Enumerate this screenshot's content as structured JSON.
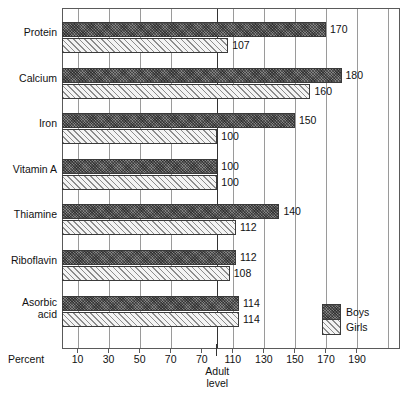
{
  "chart_data": {
    "type": "bar",
    "orientation": "horizontal",
    "title": "",
    "xlabel": "Percent",
    "ylabel": "",
    "categories": [
      "Protein",
      "Calcium",
      "Iron",
      "Vitamin A",
      "Thiamine",
      "Riboflavin",
      "Asorbic acid"
    ],
    "series": [
      {
        "name": "Boys",
        "values": [
          170,
          180,
          150,
          100,
          140,
          112,
          114
        ]
      },
      {
        "name": "Girls",
        "values": [
          107,
          160,
          100,
          100,
          112,
          108,
          114
        ]
      }
    ],
    "xlim": [
      0,
      218
    ],
    "xticks": [
      10,
      30,
      50,
      70,
      70,
      110,
      130,
      150,
      170,
      190
    ],
    "gridlines": [
      10,
      30,
      50,
      70,
      70,
      110,
      130,
      150,
      170,
      190,
      210
    ],
    "grid": true,
    "legend_position": "bottom-right",
    "annotations": [
      {
        "text": "Adult level",
        "value": 100,
        "type": "reference-line"
      }
    ]
  },
  "axis": {
    "percent_label": "Percent",
    "adult_line_1": "Adult",
    "adult_line_2": "level"
  },
  "legend": {
    "boys_label": "Boys",
    "girls_label": "Girls"
  },
  "colors": {
    "boys": "#575757",
    "girls": "#f2f2f2",
    "frame": "#5a5a5a",
    "grid": "#9a9a9a",
    "adult_line": "#333333"
  },
  "categories": [
    {
      "label": "Protein",
      "label_line2": "",
      "boys": 170,
      "girls": 107,
      "boys_text": "170",
      "girls_text": "107"
    },
    {
      "label": "Calcium",
      "label_line2": "",
      "boys": 180,
      "girls": 160,
      "boys_text": "180",
      "girls_text": "160"
    },
    {
      "label": "Iron",
      "label_line2": "",
      "boys": 150,
      "girls": 100,
      "boys_text": "150",
      "girls_text": "100"
    },
    {
      "label": "Vitamin A",
      "label_line2": "",
      "boys": 100,
      "girls": 100,
      "boys_text": "100",
      "girls_text": "100"
    },
    {
      "label": "Thiamine",
      "label_line2": "",
      "boys": 140,
      "girls": 112,
      "boys_text": "140",
      "girls_text": "112"
    },
    {
      "label": "Riboflavin",
      "label_line2": "",
      "boys": 112,
      "girls": 108,
      "boys_text": "112",
      "girls_text": "108"
    },
    {
      "label": "Asorbic",
      "label_line2": "acid",
      "boys": 114,
      "girls": 114,
      "boys_text": "114",
      "girls_text": "114"
    }
  ],
  "ticks": [
    {
      "label": "10",
      "value": 10
    },
    {
      "label": "30",
      "value": 30
    },
    {
      "label": "50",
      "value": 50
    },
    {
      "label": "70",
      "value": 70
    },
    {
      "label": "70",
      "value": 90
    },
    {
      "label": "110",
      "value": 110
    },
    {
      "label": "130",
      "value": 130
    },
    {
      "label": "150",
      "value": 150
    },
    {
      "label": "170",
      "value": 170
    },
    {
      "label": "190",
      "value": 190
    }
  ]
}
